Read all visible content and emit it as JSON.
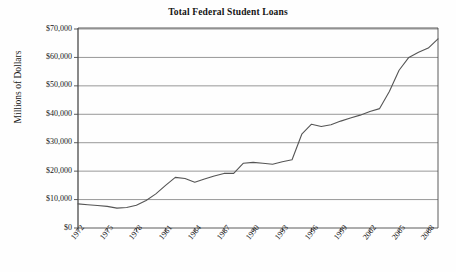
{
  "chart_data": {
    "type": "line",
    "title": "Total Federal Student Loans",
    "xlabel": "",
    "ylabel": "Millions of Dollars",
    "xlim": [
      1972,
      2009
    ],
    "ylim": [
      0,
      70000
    ],
    "grid": true,
    "legend": false,
    "y_ticks": [
      0,
      10000,
      20000,
      30000,
      40000,
      50000,
      60000,
      70000
    ],
    "y_tick_labels": [
      "$0",
      "$10,000",
      "$20,000",
      "$30,000",
      "$40,000",
      "$50,000",
      "$60,000",
      "$70,000"
    ],
    "x_ticks": [
      1972,
      1975,
      1978,
      1981,
      1984,
      1987,
      1990,
      1993,
      1996,
      1999,
      2002,
      2005,
      2008
    ],
    "x_tick_labels": [
      "1972",
      "1975",
      "1978",
      "1981",
      "1984",
      "1987",
      "1990",
      "1993",
      "1996",
      "1999",
      "2002",
      "2005",
      "2008"
    ],
    "series_name": "Total Federal Student Loans",
    "line_color": "#555555",
    "grid_color": "#8c8c8c",
    "axis_color": "#4a4a4a",
    "x": [
      1972,
      1973,
      1974,
      1975,
      1976,
      1977,
      1978,
      1979,
      1980,
      1981,
      1982,
      1983,
      1984,
      1985,
      1986,
      1987,
      1988,
      1989,
      1990,
      1991,
      1992,
      1993,
      1994,
      1995,
      1996,
      1997,
      1998,
      1999,
      2000,
      2001,
      2002,
      2003,
      2004,
      2005,
      2006,
      2007,
      2008,
      2009
    ],
    "values": [
      8500,
      8200,
      7900,
      7600,
      7000,
      7200,
      8000,
      9700,
      12000,
      15000,
      17800,
      17400,
      16100,
      17200,
      18300,
      19200,
      19200,
      22800,
      23100,
      22800,
      22400,
      23300,
      24000,
      33000,
      36500,
      35700,
      36300,
      37600,
      38700,
      39700,
      41000,
      42000,
      48000,
      55500,
      60000,
      61800,
      63300,
      66500
    ]
  }
}
